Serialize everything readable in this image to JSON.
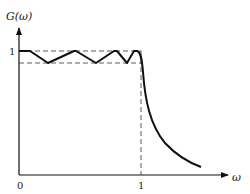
{
  "diagram": {
    "y_axis_label": "G(ω)",
    "x_axis_label": "ω",
    "y_tick_label": "1",
    "x_tick_labels": [
      "0",
      "1"
    ],
    "line_color": "#111111",
    "dash_color": "#333333"
  }
}
